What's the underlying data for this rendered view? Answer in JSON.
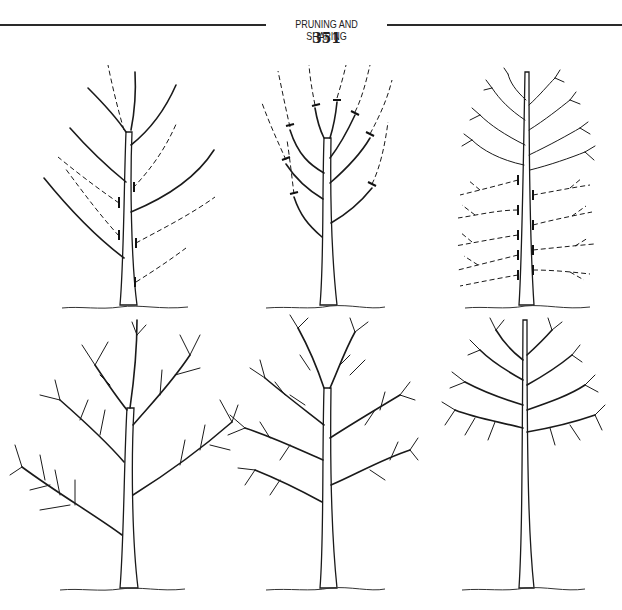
{
  "header": {
    "running_head": "PRUNING AND SHAPING",
    "page_number": "351"
  },
  "figures": [
    {
      "position": "top-left",
      "description": "Young tree with branches marked for removal (dashed) and cut lines"
    },
    {
      "position": "top-center",
      "description": "Young tree with branch tips marked for heading cuts (dashed)"
    },
    {
      "position": "top-right",
      "description": "Pyramidal tree with lower limbs marked for removal (dashed)"
    },
    {
      "position": "bottom-left",
      "description": "Resulting open, spreading tree after pruning"
    },
    {
      "position": "bottom-center",
      "description": "Resulting rounded, dense-crowned tree after pruning"
    },
    {
      "position": "bottom-right",
      "description": "Resulting high-headed tree with lower limbs removed"
    }
  ],
  "caption": {
    "partial": true,
    "note": "caption text cut off at bottom edge"
  }
}
